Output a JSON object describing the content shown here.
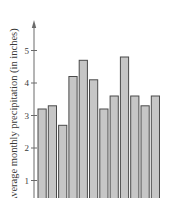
{
  "chart_data": {
    "type": "bar",
    "title": "",
    "xlabel": "",
    "ylabel": "Average monthly precipitation (in inches)",
    "categories": [
      "1",
      "2",
      "3",
      "4",
      "5",
      "6",
      "7",
      "8",
      "9",
      "10",
      "11",
      "12"
    ],
    "values": [
      3.2,
      3.3,
      2.7,
      4.2,
      4.7,
      4.1,
      3.2,
      3.6,
      4.8,
      3.6,
      3.3,
      3.6
    ],
    "yticks": [
      1,
      2,
      3,
      4,
      5
    ],
    "ylim": [
      0,
      5.6
    ],
    "grid": false,
    "legend": null,
    "colors": {
      "bar_fill": "#c6c6c6",
      "bar_stroke": "#4a4a4a",
      "axis": "#6a6a6a",
      "text": "#3a3a3a"
    }
  }
}
